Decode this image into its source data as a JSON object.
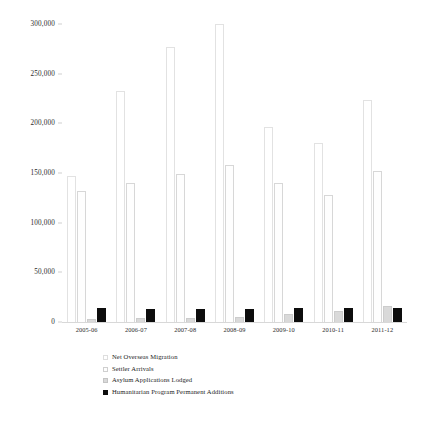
{
  "chart_data": {
    "type": "bar",
    "title": "",
    "subtitle": "",
    "xlabel": "",
    "ylabel": "",
    "grid": false,
    "legend_position": "bottom-center",
    "ylim": [
      0,
      300000
    ],
    "yticks": [
      0,
      50000,
      100000,
      150000,
      200000,
      250000,
      300000
    ],
    "ytick_labels": [
      "0",
      "50,000",
      "100,000",
      "150,000",
      "200,000",
      "250,000",
      "300,000"
    ],
    "categories": [
      "2005-06",
      "2006-07",
      "2007-08",
      "2008-09",
      "2009-10",
      "2010-11",
      "2011-12"
    ],
    "series": [
      {
        "name": "Net Overseas Migration",
        "color": "#ffffff",
        "edge_color": "#e2e2e2",
        "values": [
          146800,
          232800,
          277300,
          299900,
          196100,
          180400,
          223100
        ]
      },
      {
        "name": "Settler Arrivals",
        "color": "#fefefe",
        "edge_color": "#d7d7d7",
        "values": [
          131600,
          140100,
          149400,
          158000,
          140400,
          127500,
          152400
        ]
      },
      {
        "name": "Asylum Applications Lodged",
        "color": "#d9d9d9",
        "edge_color": "#cccccc",
        "values": [
          3500,
          3900,
          3800,
          4600,
          8200,
          11500,
          15800
        ]
      },
      {
        "name": "Humanitarian Program Permanent Additions",
        "color": "#0d0d0d",
        "edge_color": "#0d0d0d",
        "values": [
          14100,
          13000,
          13000,
          13500,
          13800,
          13800,
          13800
        ]
      }
    ]
  },
  "legend": {
    "items": [
      "Net Overseas Migration",
      "Settler Arrivals",
      "Asylum Applications Lodged",
      "Humanitarian Program Permanent Additions"
    ]
  }
}
